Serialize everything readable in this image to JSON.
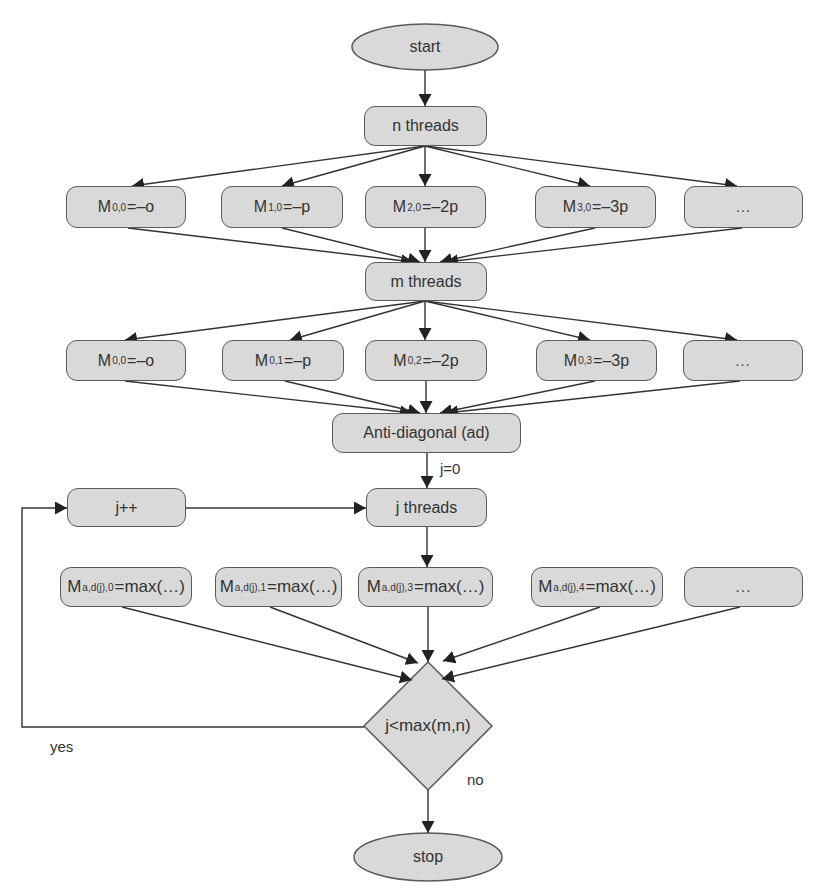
{
  "diagram": {
    "start": "start",
    "n_threads": "n threads",
    "row1": [
      {
        "base": "M",
        "sub": "0,0",
        "rest": "=–o"
      },
      {
        "base": "M",
        "sub": "1,0",
        "rest": "=–p"
      },
      {
        "base": "M",
        "sub": "2,0",
        "rest": "=–2p"
      },
      {
        "base": "M",
        "sub": "3,0",
        "rest": "=–3p"
      },
      {
        "text": "…"
      }
    ],
    "m_threads": "m threads",
    "row2": [
      {
        "base": "M",
        "sub": "0,0",
        "rest": "=–o"
      },
      {
        "base": "M",
        "sub": "0,1",
        "rest": "=–p"
      },
      {
        "base": "M",
        "sub": "0,2",
        "rest": "=–2p"
      },
      {
        "base": "M",
        "sub": "0,3",
        "rest": "=–3p"
      },
      {
        "text": "…"
      }
    ],
    "anti_diagonal": "Anti-diagonal (ad)",
    "j_init_label": "j=0",
    "j_threads": "j threads",
    "j_increment": "j++",
    "row3": [
      {
        "base": "M",
        "sub": "a,d(j),0",
        "rest": "=max(…)"
      },
      {
        "base": "M",
        "sub": "a,d(j),1",
        "rest": "=max(…)"
      },
      {
        "base": "M",
        "sub": "a,d(j),3",
        "rest": "=max(…)"
      },
      {
        "base": "M",
        "sub": "a,d(j),4",
        "rest": "=max(…)"
      },
      {
        "text": "…"
      }
    ],
    "decision": "j<max(m,n)",
    "yes_label": "yes",
    "no_label": "no",
    "stop": "stop"
  },
  "colors": {
    "node_fill": "#d9d9d9",
    "node_border": "#5a5a5a",
    "edge": "#333333",
    "text": "#333333",
    "background": "#ffffff"
  }
}
